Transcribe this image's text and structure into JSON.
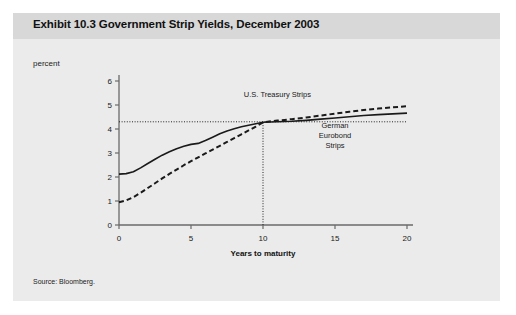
{
  "exhibit": {
    "title": "Exhibit 10.3 Government Strip Yields, December 2003",
    "unit_label": "percent",
    "source": "Source: Bloomberg.",
    "panel_bg": "#ebebeb",
    "title_band_bg": "#d8d8d8"
  },
  "chart_data": {
    "type": "line",
    "title": "Exhibit 10.3 Government Strip Yields, December 2003",
    "subtitle": "",
    "xlabel": "Years to maturity",
    "ylabel": "percent",
    "xlim": [
      0,
      20
    ],
    "ylim": [
      0,
      6
    ],
    "xticks": [
      0,
      5,
      10,
      15,
      20
    ],
    "xtick_labels": [
      "0",
      "5",
      "10",
      "15",
      "20"
    ],
    "yticks": [
      0,
      1,
      2,
      3,
      4,
      5,
      6
    ],
    "ytick_labels": [
      "0",
      "1",
      "2",
      "3",
      "4",
      "5",
      "6"
    ],
    "grid": false,
    "legend_position": "inline-annotation",
    "annotations": [
      {
        "name": "us-treasury-strips-label",
        "text": "U.S. Treasury Strips",
        "x": 11.0,
        "y": 5.35
      },
      {
        "name": "german-eurobond-strips-label",
        "text": "German\nEurobond\nStrips",
        "lines": [
          "German",
          "Eurobond",
          "Strips"
        ],
        "x": 15.0,
        "y": 4.05
      }
    ],
    "reference_lines": [
      {
        "name": "yield-reference-line",
        "orientation": "horizontal",
        "value": 4.3,
        "style": "dotted",
        "from_x": 0,
        "to_x": 20
      },
      {
        "name": "maturity-reference-line",
        "orientation": "vertical",
        "value": 10,
        "style": "dotted",
        "from_y": 0,
        "to_y": 4.3
      }
    ],
    "x": [
      0,
      0.5,
      1,
      1.5,
      2,
      2.5,
      3,
      3.5,
      4,
      4.5,
      5,
      5.5,
      6,
      6.5,
      7,
      7.5,
      8,
      8.5,
      9,
      9.5,
      10,
      11,
      12,
      13,
      14,
      15,
      16,
      17,
      18,
      19,
      20
    ],
    "series": [
      {
        "name": "German Eurobond Strips",
        "style": "solid",
        "color": "#1a1a1a",
        "values": [
          2.12,
          2.14,
          2.22,
          2.38,
          2.56,
          2.74,
          2.91,
          3.05,
          3.18,
          3.28,
          3.36,
          3.4,
          3.52,
          3.66,
          3.8,
          3.92,
          4.01,
          4.09,
          4.16,
          4.22,
          4.28,
          4.3,
          4.32,
          4.36,
          4.41,
          4.46,
          4.51,
          4.56,
          4.6,
          4.63,
          4.66
        ]
      },
      {
        "name": "U.S. Treasury Strips",
        "style": "dashed",
        "color": "#1a1a1a",
        "values": [
          0.95,
          1.03,
          1.16,
          1.34,
          1.54,
          1.74,
          1.94,
          2.13,
          2.31,
          2.49,
          2.66,
          2.82,
          2.98,
          3.14,
          3.3,
          3.46,
          3.62,
          3.78,
          3.94,
          4.1,
          4.28,
          4.35,
          4.41,
          4.48,
          4.56,
          4.64,
          4.72,
          4.79,
          4.85,
          4.9,
          4.95
        ]
      }
    ]
  }
}
